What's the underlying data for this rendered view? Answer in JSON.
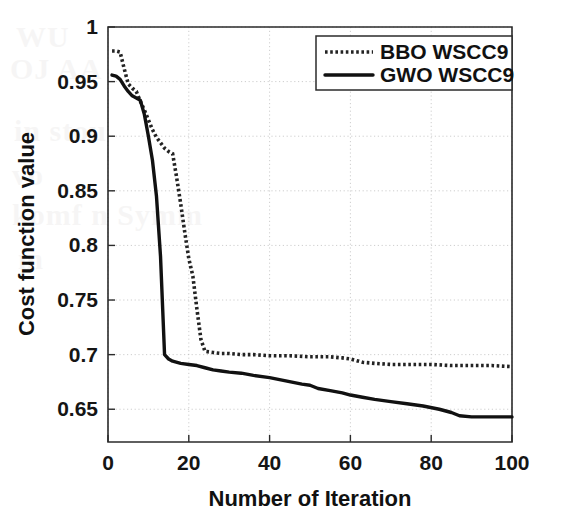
{
  "chart_data": {
    "type": "line",
    "title": "",
    "xlabel": "Number of Iteration",
    "ylabel": "Cost function value",
    "xlim": [
      0,
      100
    ],
    "ylim": [
      0.62,
      1.0
    ],
    "xticks": [
      0,
      20,
      40,
      60,
      80,
      100
    ],
    "yticks": [
      0.65,
      0.7,
      0.75,
      0.8,
      0.85,
      0.9,
      0.95,
      1
    ],
    "xtick_labels": [
      "0",
      "20",
      "40",
      "60",
      "80",
      "100"
    ],
    "ytick_labels": [
      "0.65",
      "0.7",
      "0.75",
      "0.8",
      "0.85",
      "0.9",
      "0.95",
      "1"
    ],
    "grid": true,
    "legend_position": "top-right",
    "series": [
      {
        "name": "BBO WSCC9",
        "style": "dotted",
        "color": "#232323",
        "x": [
          1,
          2,
          3,
          4,
          5,
          6,
          7,
          8,
          9,
          10,
          11,
          12,
          13,
          14,
          15,
          16,
          17,
          18,
          19,
          20,
          21,
          22,
          23,
          24,
          26,
          28,
          30,
          33,
          36,
          40,
          45,
          50,
          55,
          58,
          60,
          63,
          66,
          70,
          75,
          80,
          85,
          90,
          95,
          100
        ],
        "y": [
          0.978,
          0.978,
          0.977,
          0.962,
          0.948,
          0.944,
          0.941,
          0.932,
          0.924,
          0.915,
          0.906,
          0.899,
          0.894,
          0.889,
          0.886,
          0.884,
          0.862,
          0.838,
          0.812,
          0.788,
          0.772,
          0.742,
          0.714,
          0.703,
          0.702,
          0.701,
          0.701,
          0.7,
          0.7,
          0.699,
          0.699,
          0.698,
          0.698,
          0.697,
          0.696,
          0.693,
          0.692,
          0.691,
          0.691,
          0.691,
          0.69,
          0.69,
          0.69,
          0.689
        ]
      },
      {
        "name": "GWO WSCC9",
        "style": "solid",
        "color": "#111111",
        "x": [
          1,
          2,
          3,
          4,
          5,
          6,
          7,
          8,
          9,
          10,
          11,
          12,
          13,
          14,
          15,
          16,
          18,
          20,
          22,
          24,
          26,
          28,
          30,
          33,
          36,
          40,
          44,
          48,
          50,
          52,
          55,
          58,
          60,
          63,
          66,
          70,
          74,
          78,
          82,
          85,
          87,
          90,
          95,
          100
        ],
        "y": [
          0.956,
          0.955,
          0.952,
          0.946,
          0.941,
          0.937,
          0.935,
          0.933,
          0.92,
          0.9,
          0.878,
          0.845,
          0.79,
          0.7,
          0.696,
          0.694,
          0.692,
          0.691,
          0.69,
          0.688,
          0.686,
          0.685,
          0.684,
          0.683,
          0.681,
          0.679,
          0.676,
          0.673,
          0.672,
          0.669,
          0.667,
          0.665,
          0.663,
          0.661,
          0.659,
          0.657,
          0.655,
          0.653,
          0.65,
          0.647,
          0.644,
          0.643,
          0.643,
          0.643
        ]
      }
    ]
  },
  "legend": {
    "items": [
      {
        "label": "BBO WSCC9",
        "style": "dotted"
      },
      {
        "label": "GWO WSCC9",
        "style": "solid"
      }
    ]
  },
  "background_artifact": {
    "lines": [
      "WU",
      "OJ AA",
      "in stou",
      "vo",
      "komf n  Symm",
      "m"
    ]
  }
}
